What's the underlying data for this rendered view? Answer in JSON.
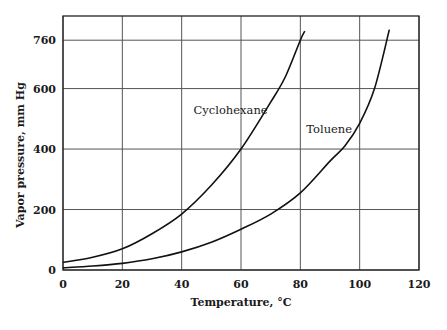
{
  "chart_data": {
    "type": "line",
    "title": "",
    "xlabel": "Temperature, °C",
    "ylabel": "Vapor pressure, mm Hg",
    "xlim": [
      0,
      120
    ],
    "ylim": [
      0,
      840
    ],
    "x_ticks": [
      0,
      20,
      40,
      60,
      80,
      100,
      120
    ],
    "x_tick_labels": [
      "0",
      "20",
      "40",
      "60",
      "80",
      "100",
      "120"
    ],
    "y_ticks": [
      0,
      200,
      400,
      600,
      760
    ],
    "y_tick_labels": [
      "0",
      "200",
      "400",
      "600",
      "760"
    ],
    "grid": true,
    "legend": "inline labels",
    "series": [
      {
        "name": "Cyclohexane",
        "x": [
          0,
          10,
          20,
          30,
          40,
          50,
          60,
          70,
          75,
          80,
          81.5
        ],
        "values": [
          25,
          42,
          70,
          120,
          185,
          280,
          400,
          555,
          640,
          760,
          790
        ]
      },
      {
        "name": "Toluene",
        "x": [
          0,
          10,
          20,
          30,
          40,
          50,
          60,
          70,
          80,
          90,
          95,
          100,
          105,
          110
        ],
        "values": [
          7,
          13,
          22,
          37,
          60,
          92,
          135,
          185,
          255,
          360,
          410,
          485,
          600,
          795
        ]
      }
    ],
    "annotations": [
      {
        "text": "Cyclohexane",
        "x": 44,
        "y": 530
      },
      {
        "text": "Toluene",
        "x": 82,
        "y": 465
      }
    ]
  }
}
